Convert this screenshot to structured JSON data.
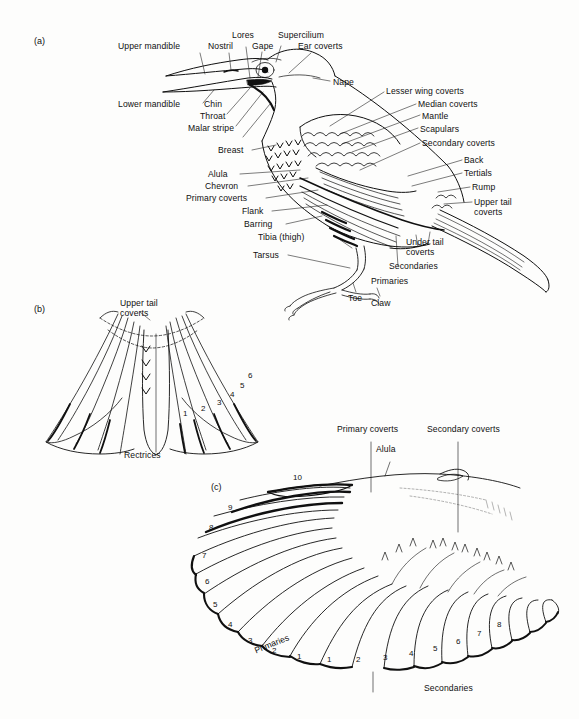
{
  "figure": {
    "background_color": "#fdfdfc",
    "ink_color": "#101010"
  },
  "panels": [
    {
      "id": "a",
      "label": "(a)",
      "caption": "Whole bird external topography"
    },
    {
      "id": "b",
      "label": "(b)",
      "caption": "Spread tail showing rectrices"
    },
    {
      "id": "c",
      "label": "(c)",
      "caption": "Spread wing showing primaries and secondaries"
    }
  ],
  "panel_a": {
    "label": "(a)",
    "labels": [
      {
        "key": "upper_mandible",
        "text": "Upper mandible"
      },
      {
        "key": "nostril",
        "text": "Nostril"
      },
      {
        "key": "lores",
        "text": "Lores"
      },
      {
        "key": "gape",
        "text": "Gape"
      },
      {
        "key": "supercilium",
        "text": "Supercilium"
      },
      {
        "key": "ear_coverts",
        "text": "Ear coverts"
      },
      {
        "key": "nape",
        "text": "Nape"
      },
      {
        "key": "lower_mandible",
        "text": "Lower mandible"
      },
      {
        "key": "chin",
        "text": "Chin"
      },
      {
        "key": "throat",
        "text": "Throat"
      },
      {
        "key": "malar_stripe",
        "text": "Malar stripe"
      },
      {
        "key": "breast",
        "text": "Breast"
      },
      {
        "key": "alula",
        "text": "Alula"
      },
      {
        "key": "chevron",
        "text": "Chevron"
      },
      {
        "key": "primary_coverts",
        "text": "Primary coverts"
      },
      {
        "key": "flank",
        "text": "Flank"
      },
      {
        "key": "barring",
        "text": "Barring"
      },
      {
        "key": "tibia",
        "text": "Tibia (thigh)"
      },
      {
        "key": "tarsus",
        "text": "Tarsus"
      },
      {
        "key": "toe",
        "text": "Toe"
      },
      {
        "key": "claw",
        "text": "Claw"
      },
      {
        "key": "lesser_wing_coverts",
        "text": "Lesser wing coverts"
      },
      {
        "key": "median_coverts",
        "text": "Median coverts"
      },
      {
        "key": "mantle",
        "text": "Mantle"
      },
      {
        "key": "scapulars",
        "text": "Scapulars"
      },
      {
        "key": "secondary_coverts",
        "text": "Secondary coverts"
      },
      {
        "key": "back",
        "text": "Back"
      },
      {
        "key": "tertials",
        "text": "Tertials"
      },
      {
        "key": "rump",
        "text": "Rump"
      },
      {
        "key": "upper_tail_coverts",
        "text": "Upper tail coverts"
      },
      {
        "key": "under_tail_coverts",
        "text": "Under tail coverts"
      },
      {
        "key": "secondaries",
        "text": "Secondaries"
      },
      {
        "key": "primaries",
        "text": "Primaries"
      }
    ]
  },
  "panel_b": {
    "label": "(b)",
    "labels": [
      {
        "key": "upper_tail_coverts",
        "text": "Upper tail coverts"
      },
      {
        "key": "rectrices",
        "text": "Rectrices"
      }
    ],
    "rectrix_numbers": [
      "1",
      "2",
      "3",
      "4",
      "5",
      "6"
    ]
  },
  "panel_c": {
    "label": "(c)",
    "labels": [
      {
        "key": "primary_coverts",
        "text": "Primary coverts"
      },
      {
        "key": "alula",
        "text": "Alula"
      },
      {
        "key": "secondary_coverts",
        "text": "Secondary coverts"
      },
      {
        "key": "primaries",
        "text": "Primaries"
      },
      {
        "key": "secondaries",
        "text": "Secondaries"
      }
    ],
    "primary_numbers": [
      "1",
      "2",
      "3",
      "4",
      "5",
      "6",
      "7",
      "8",
      "9",
      "10"
    ],
    "secondary_numbers": [
      "1",
      "2",
      "3",
      "4",
      "5",
      "6",
      "7",
      "8"
    ]
  }
}
